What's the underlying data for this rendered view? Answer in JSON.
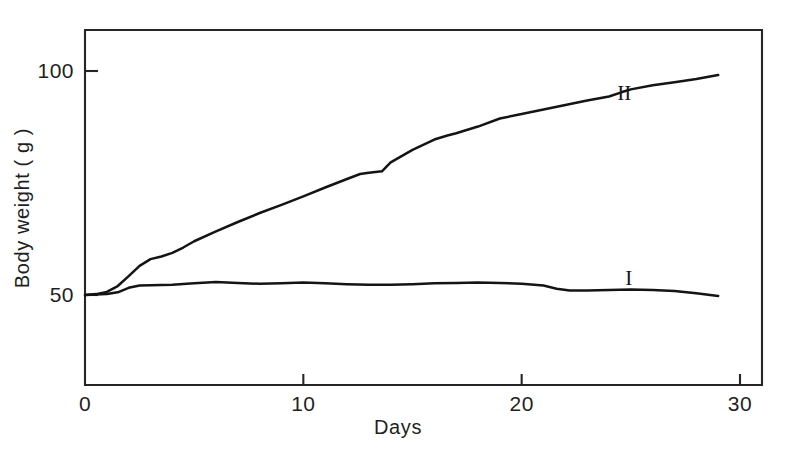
{
  "chart_data": {
    "type": "line",
    "title": "",
    "xlabel": "Days",
    "ylabel": "Body weight ( g )",
    "xlim": [
      0,
      30
    ],
    "ylim": [
      37.5,
      108
    ],
    "grid": false,
    "legend_position": "inline-right",
    "x_ticks": [
      {
        "value": 0,
        "label": "0"
      },
      {
        "value": 10,
        "label": "10"
      },
      {
        "value": 20,
        "label": "20"
      },
      {
        "value": 30,
        "label": "30"
      }
    ],
    "y_ticks": [
      {
        "value": 50,
        "label": "50"
      },
      {
        "value": 100,
        "label": "100"
      }
    ],
    "series": [
      {
        "name": "I",
        "label": "I",
        "label_x": 24.9,
        "label_y": 53.8,
        "color": "#141414",
        "x": [
          0,
          0.5,
          1,
          1.5,
          2,
          2.5,
          3,
          4,
          5,
          6,
          7,
          8,
          9,
          10,
          11,
          12,
          13,
          14,
          15,
          16,
          17,
          18,
          19,
          20,
          21,
          21.6,
          22.2,
          23,
          24,
          25,
          26,
          27,
          28,
          29
        ],
        "y": [
          50.0,
          50.1,
          50.2,
          50.6,
          51.6,
          52.1,
          52.2,
          52.3,
          52.6,
          52.9,
          52.7,
          52.5,
          52.6,
          52.8,
          52.6,
          52.4,
          52.3,
          52.3,
          52.4,
          52.6,
          52.7,
          52.8,
          52.7,
          52.5,
          52.1,
          51.4,
          51.0,
          51.0,
          51.1,
          51.2,
          51.1,
          50.9,
          50.4,
          49.8
        ]
      },
      {
        "name": "II",
        "label": "II",
        "label_x": 24.7,
        "label_y": 95.0,
        "color": "#141414",
        "x": [
          0,
          0.5,
          1,
          1.5,
          2,
          2.5,
          3,
          3.5,
          4,
          4.5,
          5,
          6,
          7,
          8,
          9,
          10,
          11,
          12,
          12.6,
          13,
          13.6,
          14,
          15,
          16,
          16.6,
          17,
          18,
          19,
          20,
          21,
          22,
          23,
          24,
          24.6,
          25,
          26,
          27,
          28,
          29
        ],
        "y": [
          50.0,
          50.2,
          50.7,
          52.0,
          54.2,
          56.5,
          58.0,
          58.6,
          59.4,
          60.6,
          62.0,
          64.2,
          66.3,
          68.3,
          70.1,
          72.0,
          74.0,
          75.9,
          77.0,
          77.3,
          77.6,
          79.6,
          82.4,
          84.7,
          85.6,
          86.1,
          87.6,
          89.4,
          90.4,
          91.4,
          92.4,
          93.4,
          94.3,
          95.3,
          95.9,
          96.8,
          97.5,
          98.2,
          99.1
        ]
      }
    ]
  }
}
